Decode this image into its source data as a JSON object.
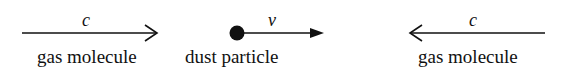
{
  "diagram": {
    "left": {
      "label": "gas molecule",
      "velocity": "c",
      "direction": "right"
    },
    "center": {
      "label": "dust particle",
      "velocity": "v",
      "direction": "right"
    },
    "right": {
      "label": "gas molecule",
      "velocity": "c",
      "direction": "left"
    }
  },
  "colors": {
    "ink": "#111111",
    "background": "#ffffff"
  }
}
